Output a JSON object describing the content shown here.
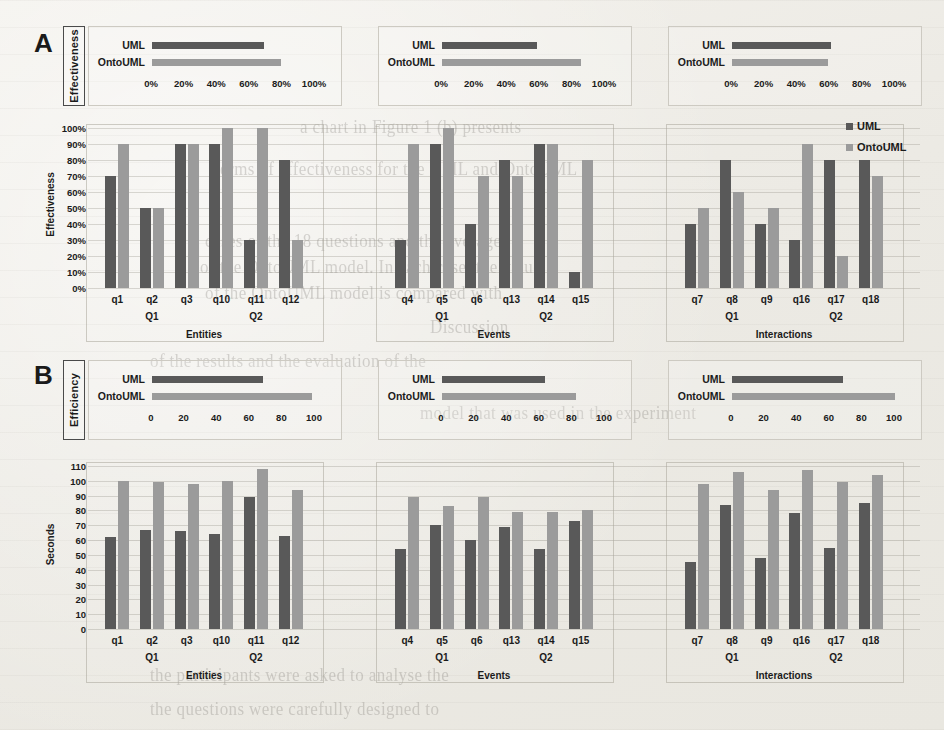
{
  "figure": {
    "panels": [
      {
        "letter": "A",
        "axis_title": "Effectiveness",
        "unit": "percent"
      },
      {
        "letter": "B",
        "axis_title": "Efficiency",
        "unit": "seconds"
      }
    ],
    "series_names": [
      "UML",
      "OntoUML"
    ],
    "colors": {
      "uml": "#595959",
      "ontouml": "#9b9b9b"
    },
    "legend": {
      "position": "top-right",
      "items": [
        "UML",
        "OntoUML"
      ]
    }
  },
  "chart_data": [
    {
      "id": "panel-a-summary-entities",
      "type": "bar",
      "orientation": "horizontal",
      "title": "Entities",
      "categories": [
        "UML",
        "OntoUML"
      ],
      "values": [
        69,
        79
      ],
      "ticks": [
        "0%",
        "20%",
        "40%",
        "60%",
        "80%",
        "100%"
      ],
      "xlim": [
        0,
        100
      ],
      "ylabel": "Effectiveness"
    },
    {
      "id": "panel-a-summary-events",
      "type": "bar",
      "orientation": "horizontal",
      "title": "Events",
      "categories": [
        "UML",
        "OntoUML"
      ],
      "values": [
        58,
        85
      ],
      "ticks": [
        "0%",
        "20%",
        "40%",
        "60%",
        "80%",
        "100%"
      ],
      "xlim": [
        0,
        100
      ],
      "ylabel": "Effectiveness"
    },
    {
      "id": "panel-a-summary-interactions",
      "type": "bar",
      "orientation": "horizontal",
      "title": "Interactions",
      "categories": [
        "UML",
        "OntoUML"
      ],
      "values": [
        61,
        59
      ],
      "ticks": [
        "0%",
        "20%",
        "40%",
        "60%",
        "80%",
        "100%"
      ],
      "xlim": [
        0,
        100
      ],
      "ylabel": "Effectiveness"
    },
    {
      "id": "panel-a-entities",
      "type": "bar",
      "title": "Entities",
      "xlabel": "Entities",
      "ylabel": "Effectiveness",
      "ylim": [
        0,
        100
      ],
      "yticks": [
        "0%",
        "10%",
        "20%",
        "30%",
        "40%",
        "50%",
        "60%",
        "70%",
        "80%",
        "90%",
        "100%"
      ],
      "categories": [
        "q1",
        "q2",
        "q3",
        "q10",
        "q11",
        "q12"
      ],
      "question_groups": [
        "Q1",
        "Q2"
      ],
      "series": [
        {
          "name": "UML",
          "values": [
            70,
            50,
            90,
            90,
            30,
            80
          ]
        },
        {
          "name": "OntoUML",
          "values": [
            90,
            50,
            90,
            100,
            100,
            30
          ]
        }
      ]
    },
    {
      "id": "panel-a-events",
      "type": "bar",
      "title": "Events",
      "xlabel": "Events",
      "ylabel": "Effectiveness",
      "ylim": [
        0,
        100
      ],
      "categories": [
        "q4",
        "q5",
        "q6",
        "q13",
        "q14",
        "q15"
      ],
      "question_groups": [
        "Q1",
        "Q2"
      ],
      "series": [
        {
          "name": "UML",
          "values": [
            30,
            90,
            40,
            80,
            90,
            10
          ]
        },
        {
          "name": "OntoUML",
          "values": [
            90,
            100,
            70,
            70,
            90,
            80
          ]
        }
      ]
    },
    {
      "id": "panel-a-interactions",
      "type": "bar",
      "title": "Interactions",
      "xlabel": "Interactions",
      "ylabel": "Effectiveness",
      "ylim": [
        0,
        100
      ],
      "categories": [
        "q7",
        "q8",
        "q9",
        "q16",
        "q17",
        "q18"
      ],
      "question_groups": [
        "Q1",
        "Q2"
      ],
      "series": [
        {
          "name": "UML",
          "values": [
            40,
            80,
            40,
            30,
            80,
            80
          ]
        },
        {
          "name": "OntoUML",
          "values": [
            50,
            60,
            50,
            90,
            20,
            70
          ]
        }
      ]
    },
    {
      "id": "panel-b-summary-entities",
      "type": "bar",
      "orientation": "horizontal",
      "title": "Entities",
      "categories": [
        "UML",
        "OntoUML"
      ],
      "values": [
        68,
        98
      ],
      "ticks": [
        "0",
        "20",
        "40",
        "60",
        "80",
        "100"
      ],
      "xlim": [
        0,
        100
      ],
      "ylabel": "Efficiency"
    },
    {
      "id": "panel-b-summary-events",
      "type": "bar",
      "orientation": "horizontal",
      "title": "Events",
      "categories": [
        "UML",
        "OntoUML"
      ],
      "values": [
        63,
        82
      ],
      "ticks": [
        "0",
        "20",
        "40",
        "60",
        "80",
        "100"
      ],
      "xlim": [
        0,
        100
      ],
      "ylabel": "Efficiency"
    },
    {
      "id": "panel-b-summary-interactions",
      "type": "bar",
      "orientation": "horizontal",
      "title": "Interactions",
      "categories": [
        "UML",
        "OntoUML"
      ],
      "values": [
        68,
        100
      ],
      "ticks": [
        "0",
        "20",
        "40",
        "60",
        "80",
        "100"
      ],
      "xlim": [
        0,
        100
      ],
      "ylabel": "Efficiency"
    },
    {
      "id": "panel-b-entities",
      "type": "bar",
      "title": "Entities",
      "xlabel": "Entities",
      "ylabel": "Seconds",
      "ylim": [
        0,
        110
      ],
      "yticks": [
        "0",
        "10",
        "20",
        "30",
        "40",
        "50",
        "60",
        "70",
        "80",
        "90",
        "100",
        "110"
      ],
      "categories": [
        "q1",
        "q2",
        "q3",
        "q10",
        "q11",
        "q12"
      ],
      "question_groups": [
        "Q1",
        "Q2"
      ],
      "series": [
        {
          "name": "UML",
          "values": [
            62,
            67,
            66,
            64,
            89,
            63
          ]
        },
        {
          "name": "OntoUML",
          "values": [
            100,
            99,
            98,
            100,
            108,
            94
          ]
        }
      ]
    },
    {
      "id": "panel-b-events",
      "type": "bar",
      "title": "Events",
      "xlabel": "Events",
      "ylabel": "Seconds",
      "ylim": [
        0,
        110
      ],
      "categories": [
        "q4",
        "q5",
        "q6",
        "q13",
        "q14",
        "q15"
      ],
      "question_groups": [
        "Q1",
        "Q2"
      ],
      "series": [
        {
          "name": "UML",
          "values": [
            54,
            70,
            60,
            69,
            54,
            73
          ]
        },
        {
          "name": "OntoUML",
          "values": [
            89,
            83,
            89,
            79,
            79,
            80
          ]
        }
      ]
    },
    {
      "id": "panel-b-interactions",
      "type": "bar",
      "title": "Interactions",
      "xlabel": "Interactions",
      "ylabel": "Seconds",
      "ylim": [
        0,
        110
      ],
      "categories": [
        "q7",
        "q8",
        "q9",
        "q16",
        "q17",
        "q18"
      ],
      "question_groups": [
        "Q1",
        "Q2"
      ],
      "series": [
        {
          "name": "UML",
          "values": [
            45,
            84,
            48,
            78,
            55,
            85
          ]
        },
        {
          "name": "OntoUML",
          "values": [
            98,
            106,
            94,
            107,
            99,
            104
          ]
        }
      ]
    }
  ],
  "background_text": [
    "a chart in Figure 1 (b) presents",
    "terms of effectiveness for the UML and OntoUML",
    "cases of the 18 questions and the average",
    "of the OntoUML model. In each case, the value",
    "of the OntoUML model is compared with",
    "Discussion",
    "of the results and the evaluation of the",
    "model that was used in the experiment",
    "the participants were asked to analyse the",
    "the questions were carefully designed to"
  ]
}
